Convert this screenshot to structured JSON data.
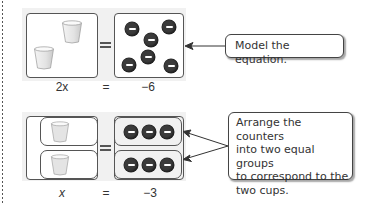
{
  "top_model": {
    "cups": 2,
    "counters": 6,
    "counter_sign": "negative",
    "equation": {
      "left": "2x",
      "equals": "=",
      "right": "−6"
    }
  },
  "bottom_model": {
    "groups": 2,
    "cups_per_group": 1,
    "counters_per_group": 3,
    "equation": {
      "left": "x",
      "equals": "=",
      "right": "−3"
    }
  },
  "callouts": {
    "model": "Model the equation.",
    "arrange": [
      "Arrange the counters",
      "into two equal groups",
      "to correspond to the",
      "two cups."
    ]
  },
  "icons": {
    "cup": "paper-cup-icon",
    "counter": "negative-counter-icon"
  },
  "colors": {
    "counter": "#3b3b3b",
    "panel_bg": "#f1f1f1",
    "border": "#555555"
  }
}
